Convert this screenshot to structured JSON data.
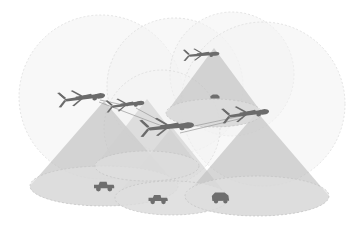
{
  "figure": {
    "background_color": "#ffffff",
    "width": 364,
    "height": 227
  },
  "palette": {
    "comm_circle_fill": "#f2f2f2",
    "comm_circle_stroke": "#d9d9d9",
    "cone_fill": "#bdbdbd",
    "cone_fill_light": "#cfcfcf",
    "footprint_fill": "#e0e0e0",
    "footprint_stroke": "#c2c2c2",
    "drone_color": "#6b6b6b",
    "drone_color_dark": "#575757",
    "vehicle_color": "#6e6e6e",
    "link_color": "#9a9a9a"
  },
  "comm_circles": [
    {
      "id": "comm-range-1",
      "cx": 101,
      "cy": 97,
      "r": 82,
      "label": "communication range 1"
    },
    {
      "id": "comm-range-2",
      "cx": 175,
      "cy": 86,
      "r": 68,
      "label": "communication range 2"
    },
    {
      "id": "comm-range-3",
      "cx": 232,
      "cy": 74,
      "r": 62,
      "label": "communication range 3"
    },
    {
      "id": "comm-range-4",
      "cx": 263,
      "cy": 104,
      "r": 82,
      "label": "communication range 4"
    },
    {
      "id": "comm-range-5",
      "cx": 162,
      "cy": 128,
      "r": 58,
      "label": "communication range 5"
    }
  ],
  "sensor_cones": [
    {
      "id": "cone-1",
      "apex_x": 104,
      "apex_y": 101,
      "base_cx": 104,
      "base_cy": 186,
      "base_rx": 74,
      "base_ry": 20,
      "shade": "dark",
      "label": "sensor footprint cone 1"
    },
    {
      "id": "cone-2",
      "apex_x": 147,
      "apex_y": 99,
      "base_cx": 147,
      "base_cy": 166,
      "base_rx": 52,
      "base_ry": 15,
      "shade": "light",
      "label": "sensor footprint cone 2"
    },
    {
      "id": "cone-3",
      "apex_x": 214,
      "apex_y": 48,
      "base_cx": 214,
      "base_cy": 113,
      "base_rx": 48,
      "base_ry": 14,
      "shade": "dark",
      "label": "sensor footprint cone 3"
    },
    {
      "id": "cone-4",
      "apex_x": 172,
      "apex_y": 127,
      "base_cx": 172,
      "base_cy": 198,
      "base_rx": 57,
      "base_ry": 17,
      "shade": "light",
      "label": "sensor footprint cone 4"
    },
    {
      "id": "cone-5",
      "apex_x": 257,
      "apex_y": 112,
      "base_cx": 257,
      "base_cy": 196,
      "base_rx": 72,
      "base_ry": 20,
      "shade": "dark",
      "label": "sensor footprint cone 5"
    }
  ],
  "drones": [
    {
      "id": "drone-1",
      "x": 85,
      "y": 97,
      "scale": 1.05,
      "rotation": -6,
      "label": "uav-1"
    },
    {
      "id": "drone-2",
      "x": 128,
      "y": 104,
      "scale": 0.85,
      "rotation": -6,
      "label": "uav-2"
    },
    {
      "id": "drone-3",
      "x": 171,
      "y": 126,
      "scale": 1.2,
      "rotation": -4,
      "label": "uav-3-lead"
    },
    {
      "id": "drone-4",
      "x": 249,
      "y": 113,
      "scale": 1.05,
      "rotation": -6,
      "label": "uav-4"
    },
    {
      "id": "drone-5",
      "x": 204,
      "y": 54,
      "scale": 0.8,
      "rotation": -3,
      "label": "uav-5"
    }
  ],
  "links": [
    {
      "id": "link-1-2",
      "from": "drone-1",
      "to": "drone-2",
      "x1": 100,
      "y1": 100,
      "x2": 128,
      "y2": 106
    },
    {
      "id": "link-2-3",
      "from": "drone-2",
      "to": "drone-3",
      "x1": 136,
      "y1": 108,
      "x2": 171,
      "y2": 127
    },
    {
      "id": "link-3-4",
      "from": "drone-3",
      "to": "drone-4",
      "x1": 185,
      "y1": 128,
      "x2": 246,
      "y2": 115
    },
    {
      "id": "link-1-3",
      "from": "drone-1",
      "to": "drone-3",
      "x1": 99,
      "y1": 102,
      "x2": 170,
      "y2": 129
    },
    {
      "id": "link-3-4b",
      "from": "drone-3",
      "to": "drone-4",
      "x1": 180,
      "y1": 133,
      "x2": 243,
      "y2": 118
    }
  ],
  "ground_targets": [
    {
      "id": "vehicle-1",
      "type": "jeep",
      "x": 104,
      "y": 186,
      "scale": 1.0,
      "label": "ground vehicle 1"
    },
    {
      "id": "vehicle-2",
      "type": "jeep",
      "x": 158,
      "y": 199,
      "scale": 0.95,
      "label": "ground vehicle 2"
    },
    {
      "id": "vehicle-3",
      "type": "truck",
      "x": 221,
      "y": 198,
      "scale": 1.0,
      "label": "ground vehicle 3"
    },
    {
      "id": "vehicle-4",
      "type": "small",
      "x": 215,
      "y": 97,
      "scale": 0.62,
      "label": "ground vehicle 4"
    }
  ]
}
